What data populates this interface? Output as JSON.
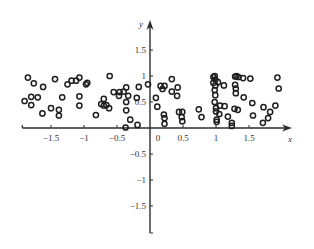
{
  "chart_data": {
    "type": "scatter",
    "title": "",
    "xlabel": "x",
    "ylabel": "y",
    "xlim": [
      -1.95,
      2.15
    ],
    "ylim": [
      -1.95,
      1.9
    ],
    "x_ticks": [
      -1.5,
      -1,
      -0.5,
      0,
      0.5,
      1,
      1.5
    ],
    "x_tick_labels": [
      "−1.5",
      "−1",
      "−0.5",
      "0",
      "0.5",
      "1",
      "1.5"
    ],
    "y_ticks": [
      -1.5,
      -1,
      -0.5,
      0.5,
      1,
      1.5
    ],
    "y_tick_labels": [
      "−1.5",
      "−1",
      "−0.5",
      "0.5",
      "1",
      "1.5"
    ],
    "grid": false,
    "legend": null,
    "marker": "open-circle",
    "series": [
      {
        "name": "points",
        "points": [
          [
            -1.9,
            0.52
          ],
          [
            -1.85,
            0.97
          ],
          [
            -1.8,
            0.6
          ],
          [
            -1.8,
            0.44
          ],
          [
            -1.76,
            0.86
          ],
          [
            -1.7,
            0.59
          ],
          [
            -1.62,
            0.79
          ],
          [
            -1.63,
            0.28
          ],
          [
            -1.5,
            0.38
          ],
          [
            -1.44,
            0.94
          ],
          [
            -1.38,
            0.35
          ],
          [
            -1.38,
            0.24
          ],
          [
            -1.33,
            0.59
          ],
          [
            -1.25,
            0.84
          ],
          [
            -1.19,
            0.91
          ],
          [
            -1.12,
            0.91
          ],
          [
            -1.07,
            0.97
          ],
          [
            -1.07,
            0.61
          ],
          [
            -1.07,
            0.43
          ],
          [
            -0.97,
            0.84
          ],
          [
            -0.95,
            0.87
          ],
          [
            -0.82,
            0.25
          ],
          [
            -0.74,
            0.46
          ],
          [
            -0.7,
            0.43
          ],
          [
            -0.7,
            0.56
          ],
          [
            -0.66,
            0.44
          ],
          [
            -0.62,
            0.38
          ],
          [
            -0.61,
            1.0
          ],
          [
            -0.55,
            0.69
          ],
          [
            -0.47,
            0.62
          ],
          [
            -0.46,
            0.69
          ],
          [
            -0.4,
            0.7
          ],
          [
            -0.36,
            0.78
          ],
          [
            -0.36,
            0.34
          ],
          [
            -0.36,
            0.5
          ],
          [
            -0.33,
            0.62
          ],
          [
            -0.3,
            0.16
          ],
          [
            -0.37,
            0.01
          ],
          [
            -0.2,
            0.58
          ],
          [
            -0.19,
            0.06
          ],
          [
            -0.17,
            0.79
          ],
          [
            -0.03,
            0.84
          ],
          [
            0.09,
            0.58
          ],
          [
            0.11,
            0.41
          ],
          [
            0.16,
            0.81
          ],
          [
            0.19,
            0.75
          ],
          [
            0.22,
            0.81
          ],
          [
            0.21,
            0.26
          ],
          [
            0.22,
            0.19
          ],
          [
            0.22,
            0.08
          ],
          [
            0.33,
            0.94
          ],
          [
            0.33,
            0.7
          ],
          [
            0.42,
            0.78
          ],
          [
            0.41,
            0.62
          ],
          [
            0.44,
            0.31
          ],
          [
            0.48,
            0.21
          ],
          [
            0.49,
            0.31
          ],
          [
            0.49,
            0.13
          ],
          [
            0.74,
            0.36
          ],
          [
            0.78,
            0.21
          ],
          [
            0.96,
            0.87
          ],
          [
            0.96,
            0.98
          ],
          [
            0.98,
            1.0
          ],
          [
            0.99,
            0.93
          ],
          [
            0.99,
            0.82
          ],
          [
            0.98,
            0.73
          ],
          [
            0.99,
            0.63
          ],
          [
            0.98,
            0.5
          ],
          [
            1.0,
            0.38
          ],
          [
            1.0,
            0.32
          ],
          [
            1.01,
            0.12
          ],
          [
            1.01,
            0.16
          ],
          [
            1.03,
            0.88
          ],
          [
            1.05,
            0.27
          ],
          [
            1.06,
            0.43
          ],
          [
            1.12,
            0.82
          ],
          [
            1.13,
            0.42
          ],
          [
            1.18,
            0.22
          ],
          [
            1.24,
            0.04
          ],
          [
            1.24,
            0.1
          ],
          [
            1.28,
            0.37
          ],
          [
            1.29,
            0.99
          ],
          [
            1.29,
            0.83
          ],
          [
            1.3,
            0.76
          ],
          [
            1.3,
            0.67
          ],
          [
            1.31,
            1.0
          ],
          [
            1.33,
            0.35
          ],
          [
            1.34,
            0.98
          ],
          [
            1.41,
            0.96
          ],
          [
            1.42,
            0.59
          ],
          [
            1.52,
            0.95
          ],
          [
            1.55,
            0.48
          ],
          [
            1.56,
            0.24
          ],
          [
            1.71,
            0.1
          ],
          [
            1.72,
            0.4
          ],
          [
            1.79,
            0.19
          ],
          [
            1.82,
            0.31
          ],
          [
            1.9,
            0.43
          ],
          [
            1.93,
            0.97
          ],
          [
            1.95,
            0.76
          ]
        ]
      }
    ],
    "caption": ""
  },
  "axes": {
    "x_name": "x",
    "y_name": "y",
    "origin_label": "0"
  },
  "colors": {
    "axis": "#2b2b2b",
    "marker_stroke": "#1e1e1e",
    "text": "#333333",
    "background": "#ffffff"
  }
}
